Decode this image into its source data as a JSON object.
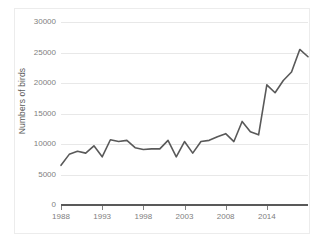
{
  "chart_data": {
    "type": "line",
    "title": "",
    "xlabel": "",
    "ylabel": "Numbers of birds",
    "xlim": [
      1988,
      2018
    ],
    "ylim": [
      0,
      30000
    ],
    "grid": true,
    "legend": "none",
    "y_ticks": [
      30000,
      25000,
      20000,
      15000,
      10000,
      5000,
      0
    ],
    "y_tick_labels": [
      "30000",
      "25000",
      "20000",
      "15000",
      "10000",
      "5000",
      "0"
    ],
    "x_ticks": [
      1988,
      1993,
      1998,
      2003,
      2008,
      2014
    ],
    "x_tick_labels": [
      "1988",
      "1993",
      "1998",
      "2003",
      "2008",
      "2014"
    ],
    "series": [
      {
        "name": "Numbers of birds",
        "color": "#595959",
        "x": [
          1988,
          1989,
          1990,
          1991,
          1992,
          1993,
          1994,
          1995,
          1996,
          1997,
          1998,
          1999,
          2000,
          2001,
          2002,
          2003,
          2004,
          2005,
          2006,
          2007,
          2008,
          2009,
          2010,
          2011,
          2012,
          2013,
          2014,
          2015,
          2016,
          2017,
          2018
        ],
        "values": [
          6500,
          8300,
          8800,
          8500,
          9700,
          7900,
          10700,
          10400,
          10600,
          9400,
          9100,
          9200,
          9200,
          10600,
          7900,
          10400,
          8500,
          10400,
          10600,
          11200,
          11700,
          10400,
          13700,
          12000,
          11500,
          19700,
          18400,
          20400,
          21800,
          25500,
          24300
        ]
      }
    ]
  },
  "axis": {
    "y_title": "Numbers of birds"
  }
}
